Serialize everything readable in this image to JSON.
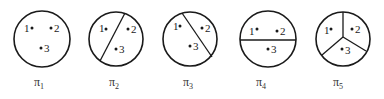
{
  "diagram": {
    "partitions": [
      {
        "label": "π",
        "subscript": "1",
        "blocks": [
          [
            "1",
            "2",
            "3"
          ]
        ],
        "points": [
          "1",
          "2",
          "3"
        ]
      },
      {
        "label": "π",
        "subscript": "2",
        "blocks": [
          [
            "1"
          ],
          [
            "2",
            "3"
          ]
        ],
        "points": [
          "1",
          "2",
          "3"
        ]
      },
      {
        "label": "π",
        "subscript": "3",
        "blocks": [
          [
            "1",
            "3"
          ],
          [
            "2"
          ]
        ],
        "points": [
          "1",
          "2",
          "3"
        ]
      },
      {
        "label": "π",
        "subscript": "4",
        "blocks": [
          [
            "1",
            "2"
          ],
          [
            "3"
          ]
        ],
        "points": [
          "1",
          "2",
          "3"
        ]
      },
      {
        "label": "π",
        "subscript": "5",
        "blocks": [
          [
            "1"
          ],
          [
            "2"
          ],
          [
            "3"
          ]
        ],
        "points": [
          "1",
          "2",
          "3"
        ]
      }
    ]
  }
}
